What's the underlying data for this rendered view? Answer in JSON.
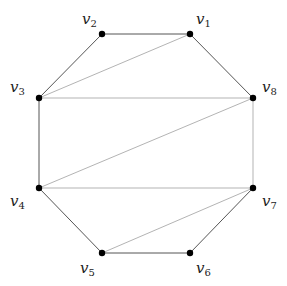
{
  "diagram": {
    "type": "graph",
    "colors": {
      "background": "#ffffff",
      "vertex": "#000000",
      "edge_dark": "#555555",
      "edge_light": "#aaaaaa",
      "label": "#222222"
    },
    "vertices": [
      {
        "id": "v1",
        "name": "v",
        "index": "1",
        "x": 190,
        "y": 34,
        "lx": 196,
        "ly": 24
      },
      {
        "id": "v2",
        "name": "v",
        "index": "2",
        "x": 102,
        "y": 34,
        "lx": 82,
        "ly": 24
      },
      {
        "id": "v3",
        "name": "v",
        "index": "3",
        "x": 39,
        "y": 98,
        "lx": 10,
        "ly": 92
      },
      {
        "id": "v4",
        "name": "v",
        "index": "4",
        "x": 39,
        "y": 188,
        "lx": 10,
        "ly": 206
      },
      {
        "id": "v5",
        "name": "v",
        "index": "5",
        "x": 102,
        "y": 253,
        "lx": 80,
        "ly": 273
      },
      {
        "id": "v6",
        "name": "v",
        "index": "6",
        "x": 190,
        "y": 253,
        "lx": 196,
        "ly": 273
      },
      {
        "id": "v7",
        "name": "v",
        "index": "7",
        "x": 253,
        "y": 188,
        "lx": 262,
        "ly": 206
      },
      {
        "id": "v8",
        "name": "v",
        "index": "8",
        "x": 253,
        "y": 98,
        "lx": 262,
        "ly": 92
      }
    ],
    "edges": [
      {
        "from": "v1",
        "to": "v2",
        "style": "dark"
      },
      {
        "from": "v2",
        "to": "v3",
        "style": "dark"
      },
      {
        "from": "v3",
        "to": "v4",
        "style": "dark"
      },
      {
        "from": "v4",
        "to": "v5",
        "style": "dark"
      },
      {
        "from": "v5",
        "to": "v6",
        "style": "dark"
      },
      {
        "from": "v6",
        "to": "v7",
        "style": "dark"
      },
      {
        "from": "v7",
        "to": "v8",
        "style": "light"
      },
      {
        "from": "v8",
        "to": "v1",
        "style": "dark"
      },
      {
        "from": "v3",
        "to": "v1",
        "style": "light"
      },
      {
        "from": "v3",
        "to": "v8",
        "style": "light"
      },
      {
        "from": "v4",
        "to": "v8",
        "style": "light"
      },
      {
        "from": "v4",
        "to": "v7",
        "style": "light"
      },
      {
        "from": "v5",
        "to": "v7",
        "style": "light"
      }
    ]
  }
}
